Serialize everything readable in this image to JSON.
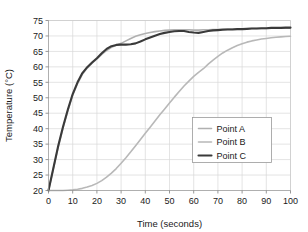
{
  "chart_data": {
    "type": "line",
    "title": "",
    "xlabel": "Time (seconds)",
    "ylabel": "Temperature (°C)",
    "xlim": [
      0,
      100
    ],
    "ylim": [
      20,
      75
    ],
    "xticks": [
      0,
      10,
      20,
      30,
      40,
      50,
      60,
      70,
      80,
      90,
      100
    ],
    "yticks": [
      20,
      25,
      30,
      35,
      40,
      45,
      50,
      55,
      60,
      65,
      70,
      75
    ],
    "grid": "horizontal-and-vertical",
    "legend_position": "center-right",
    "x": [
      0,
      2,
      4,
      6,
      8,
      10,
      12,
      14,
      16,
      18,
      20,
      22,
      24,
      26,
      28,
      30,
      32,
      34,
      36,
      38,
      40,
      42,
      44,
      46,
      48,
      50,
      52,
      54,
      56,
      58,
      60,
      62,
      64,
      66,
      68,
      70,
      72,
      74,
      76,
      78,
      80,
      82,
      84,
      86,
      88,
      90,
      92,
      94,
      96,
      98,
      100
    ],
    "series": [
      {
        "name": "Point A",
        "color": "#b0b0b0",
        "width": 1.6,
        "values": [
          20.0,
          27.0,
          34.0,
          40.2,
          45.8,
          50.8,
          54.6,
          57.6,
          59.6,
          61.2,
          62.6,
          64.0,
          65.3,
          66.3,
          67.0,
          67.6,
          68.4,
          69.2,
          69.9,
          70.4,
          70.8,
          71.1,
          71.4,
          71.6,
          71.8,
          71.9,
          72.0,
          72.0,
          72.0,
          72.0,
          71.9,
          71.9,
          72.0,
          72.0,
          72.1,
          72.1,
          72.2,
          72.2,
          72.2,
          72.3,
          72.3,
          72.3,
          72.4,
          72.4,
          72.4,
          72.4,
          72.5,
          72.5,
          72.5,
          72.5,
          72.5
        ]
      },
      {
        "name": "Point B",
        "color": "#b8b8b8",
        "width": 1.6,
        "values": [
          20.0,
          20.0,
          20.0,
          20.0,
          20.1,
          20.2,
          20.4,
          20.7,
          21.1,
          21.6,
          22.3,
          23.2,
          24.3,
          25.6,
          27.1,
          28.8,
          30.6,
          32.5,
          34.5,
          36.5,
          38.5,
          40.5,
          42.5,
          44.5,
          46.4,
          48.3,
          50.2,
          52.0,
          53.8,
          55.4,
          56.9,
          58.2,
          59.4,
          60.9,
          62.2,
          63.4,
          64.5,
          65.4,
          66.2,
          66.9,
          67.5,
          68.0,
          68.4,
          68.7,
          69.0,
          69.2,
          69.4,
          69.6,
          69.7,
          69.8,
          69.9
        ]
      },
      {
        "name": "Point C",
        "color": "#3a3a3a",
        "width": 2.1,
        "values": [
          20.0,
          27.2,
          34.4,
          40.6,
          46.2,
          51.2,
          55.0,
          58.0,
          59.9,
          61.4,
          62.8,
          64.4,
          65.8,
          66.7,
          67.1,
          67.2,
          67.2,
          67.3,
          67.6,
          68.2,
          68.9,
          69.5,
          70.1,
          70.6,
          71.0,
          71.3,
          71.5,
          71.6,
          71.6,
          71.3,
          71.1,
          71.0,
          71.3,
          71.6,
          71.8,
          71.9,
          72.0,
          72.1,
          72.1,
          72.2,
          72.2,
          72.3,
          72.4,
          72.4,
          72.5,
          72.5,
          72.6,
          72.6,
          72.6,
          72.7,
          72.7
        ]
      }
    ]
  },
  "legend": {
    "entries": [
      {
        "label": "Point A"
      },
      {
        "label": "Point B"
      },
      {
        "label": "Point C"
      }
    ]
  },
  "axes": {
    "x_label": "Time (seconds)",
    "y_label": "Temperature (°C)",
    "x_tick_labels": [
      "0",
      "10",
      "20",
      "30",
      "40",
      "50",
      "60",
      "70",
      "80",
      "90",
      "100"
    ],
    "y_tick_labels": [
      "20",
      "25",
      "30",
      "35",
      "40",
      "45",
      "50",
      "55",
      "60",
      "65",
      "70",
      "75"
    ]
  }
}
